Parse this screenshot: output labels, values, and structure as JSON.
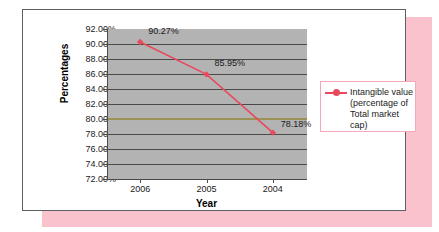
{
  "chart_data": {
    "type": "line",
    "title": "",
    "xlabel": "Year",
    "ylabel": "Percentages",
    "categories": [
      "2006",
      "2005",
      "2004"
    ],
    "series": [
      {
        "name": "Intangible value (percentage of Total market cap)",
        "values": [
          90.27,
          85.95,
          78.18
        ],
        "value_labels": [
          "90.27%",
          "85.95%",
          "78.18%"
        ],
        "color": "#e8495c",
        "marker": "diamond"
      },
      {
        "name": "reference-line-80",
        "values": [
          80.0,
          80.0,
          80.0
        ],
        "color": "#9b9255",
        "marker": "none"
      }
    ],
    "ylim": [
      72.0,
      92.0
    ],
    "ytick_step": 2.0,
    "ytick_labels": [
      "92.00%",
      "90.00%",
      "88.00%",
      "86.00%",
      "84.00%",
      "82.00%",
      "80.00%",
      "78.00%",
      "76.00%",
      "74.00%",
      "72.00%"
    ],
    "ytick_values": [
      92,
      90,
      88,
      86,
      84,
      82,
      80,
      78,
      76,
      74,
      72
    ],
    "grid": true,
    "grid_color": "#4a4a4a",
    "plot_background": "#b3b3b3",
    "legend_position": "right",
    "legend_entries": [
      "Intangible value\n(percentage of\nTotal market cap)"
    ]
  },
  "frame": {
    "card_background": "#ffffff",
    "card_border": "#5b5f63",
    "shadow_color": "#f9c2cd",
    "legend_border": "#f2a8b8"
  }
}
